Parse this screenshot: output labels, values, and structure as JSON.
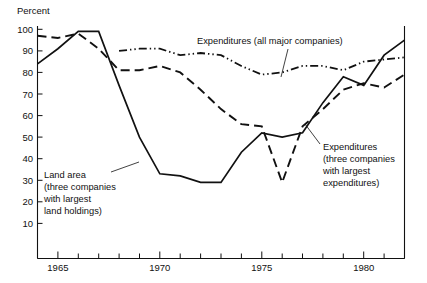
{
  "chart_data": {
    "type": "line",
    "title": "",
    "ylabel": "Percent",
    "xlabel": "",
    "ylim": [
      0,
      100
    ],
    "xlim": [
      1964,
      1982
    ],
    "grid": false,
    "legend_position": "inline-annotations",
    "y_ticks": [
      10,
      20,
      30,
      40,
      50,
      60,
      70,
      80,
      90,
      100
    ],
    "y_tick_labels": [
      "10",
      "20",
      "30",
      "40",
      "50",
      "60",
      "70",
      "80",
      "90",
      "100"
    ],
    "x_ticks": [
      1964,
      1965,
      1966,
      1967,
      1968,
      1969,
      1970,
      1971,
      1972,
      1973,
      1974,
      1975,
      1976,
      1977,
      1978,
      1979,
      1980,
      1981,
      1982
    ],
    "x_tick_labels_shown": [
      "1965",
      "1970",
      "1975",
      "1980"
    ],
    "x_labeled_years": [
      1965,
      1970,
      1975,
      1980
    ],
    "x": [
      1964,
      1965,
      1966,
      1967,
      1968,
      1969,
      1970,
      1971,
      1972,
      1973,
      1974,
      1975,
      1976,
      1977,
      1978,
      1979,
      1980,
      1981,
      1982
    ],
    "series": [
      {
        "name": "Land area (three companies with largest land holdings)",
        "style": "solid",
        "values": [
          84,
          91,
          99,
          99,
          74,
          50,
          33,
          32,
          29,
          29,
          43,
          52,
          50,
          52,
          66,
          78,
          74,
          88,
          95
        ]
      },
      {
        "name": "Expenditures (all major companies)",
        "style": "dash-dot",
        "values": [
          null,
          null,
          null,
          null,
          90,
          91,
          91,
          88,
          89,
          88,
          83,
          79,
          80,
          83,
          83,
          81,
          85,
          86,
          87
        ]
      },
      {
        "name": "Expenditures (three companies with largest expenditures)",
        "style": "dashed",
        "values": [
          97,
          96,
          98,
          91,
          81,
          81,
          83,
          80,
          72,
          63,
          56,
          55,
          29,
          55,
          63,
          72,
          75,
          73,
          79
        ]
      }
    ],
    "annotations": [
      {
        "id": "annotation-expenditures-all",
        "text": "Expenditures (all major companies)",
        "lines": [
          "Expenditures (all major companies)"
        ]
      },
      {
        "id": "annotation-land-area",
        "text": "Land area (three companies with largest land holdings)",
        "lines": [
          "Land area",
          "(three companies",
          "with largest",
          "land holdings)"
        ]
      },
      {
        "id": "annotation-expenditures-three",
        "text": "Expenditures (three companies with largest expenditures)",
        "lines": [
          "Expenditures",
          "(three companies",
          "with largest",
          "expenditures)"
        ]
      }
    ],
    "colors": {
      "ink": "#111111",
      "background": "#ffffff"
    }
  },
  "axis": {
    "y_axis_title": "Percent",
    "y_labels": [
      "100",
      "90",
      "80",
      "70",
      "60",
      "50",
      "40",
      "30",
      "20",
      "10"
    ],
    "x_labels": [
      "1965",
      "1970",
      "1975",
      "1980"
    ]
  },
  "annotations": {
    "expenditures_all": {
      "line1": "Expenditures (all major companies)"
    },
    "land_area": {
      "line1": "Land area",
      "line2": "(three companies",
      "line3": "with largest",
      "line4": "land holdings)"
    },
    "expenditures_three": {
      "line1": "Expenditures",
      "line2": "(three companies",
      "line3": "with largest",
      "line4": "expenditures)"
    }
  }
}
